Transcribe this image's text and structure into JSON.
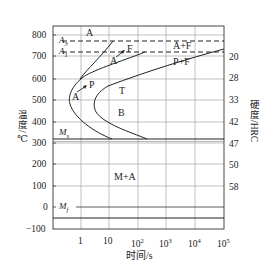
{
  "diagram": {
    "type": "TTT / isothermal transformation diagram (hypoeutectoid steel)",
    "y_left_axis": {
      "label": "温度/℃",
      "ticks": [
        "800",
        "700",
        "600",
        "500",
        "400",
        "300",
        "200",
        "100",
        "0",
        "−100"
      ]
    },
    "y_right_axis": {
      "label": "硬度/HRC",
      "ticks": [
        "20",
        "28",
        "33",
        "42",
        "47",
        "50",
        "58"
      ]
    },
    "x_axis": {
      "label": "时间/s",
      "ticks": [
        "1",
        "10",
        "10",
        "10",
        "10",
        "10"
      ],
      "tick_exponents": [
        "",
        "",
        "2",
        "3",
        "4",
        "5"
      ]
    },
    "lines": {
      "A3": "A",
      "A3_sub": "3",
      "A1": "A",
      "A1_sub": "1",
      "Ms": "M",
      "Ms_sub": "s",
      "Mf": "M",
      "Mf_sub": "f"
    },
    "regions": {
      "austenite_top": "A",
      "a_plus_f": "A+F",
      "p_plus_f": "P+F",
      "a_to_f_A": "A",
      "a_to_f_F": "F",
      "a_to_p_A": "A",
      "a_to_p_P": "P",
      "troostite": "T",
      "bainite": "B",
      "martensite_austenite": "M+A"
    },
    "colors": {
      "line": "#222222",
      "grid": "#9a9a9a",
      "background": "#ffffff"
    }
  }
}
